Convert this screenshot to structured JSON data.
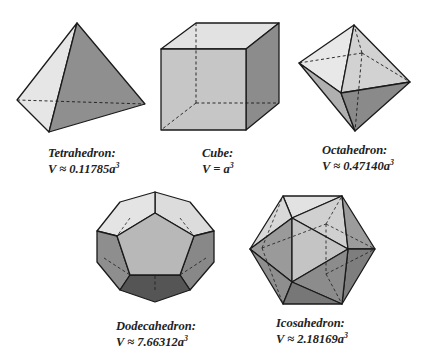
{
  "solids": [
    {
      "id": "tetrahedron",
      "name": "Tetrahedron:",
      "formula_prefix": "V ≈ 0.11785a",
      "exponent": "3"
    },
    {
      "id": "cube",
      "name": "Cube:",
      "formula_prefix": "V = a",
      "exponent": "3"
    },
    {
      "id": "octahedron",
      "name": "Octahedron:",
      "formula_prefix": "V ≈ 0.47140a",
      "exponent": "3"
    },
    {
      "id": "dodecahedron",
      "name": "Dodecahedron:",
      "formula_prefix": "V ≈ 7.66312a",
      "exponent": "3"
    },
    {
      "id": "icosahedron",
      "name": "Icosahedron:",
      "formula_prefix": "V ≈ 2.18169a",
      "exponent": "3"
    }
  ],
  "colors": {
    "light": "#e6e6e6",
    "mid": "#c4c4c4",
    "midDark": "#a8a8a8",
    "dark": "#8c8c8c",
    "darkest": "#5e5e5e",
    "stroke": "#1a1a1a"
  }
}
